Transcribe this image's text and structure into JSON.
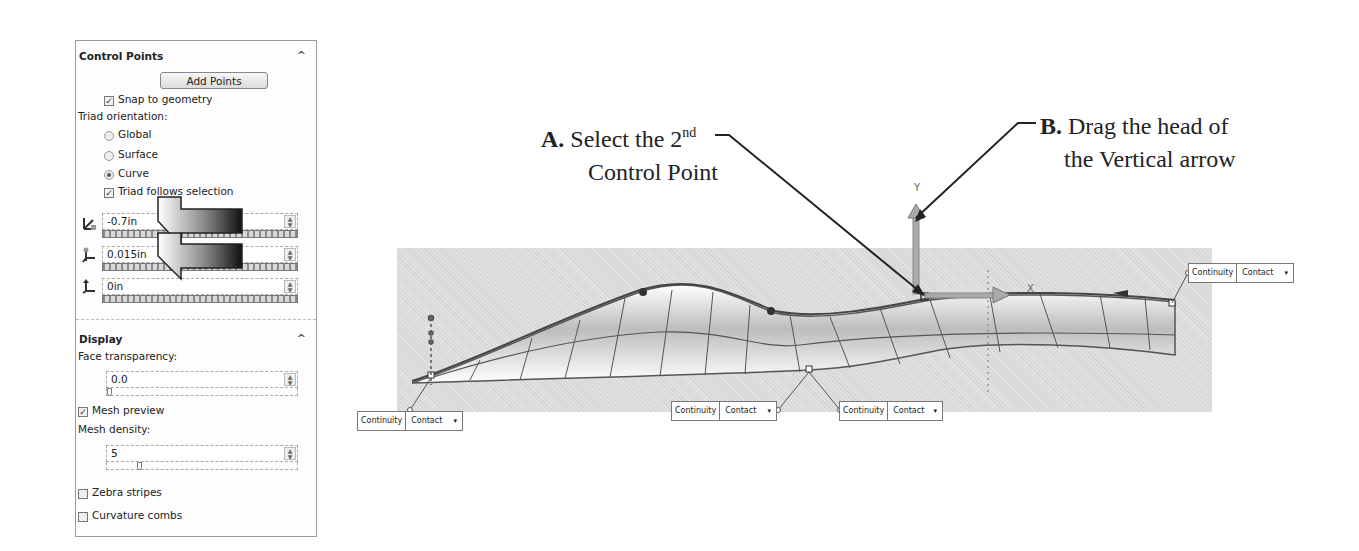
{
  "panel": {
    "control_points": {
      "title": "Control Points",
      "collapse_icon": "^",
      "add_points_label": "Add Points",
      "snap_to_geometry": {
        "label": "Snap to geometry",
        "checked": true
      },
      "triad_orientation_label": "Triad orientation:",
      "orientation_options": [
        {
          "label": "Global",
          "selected": false
        },
        {
          "label": "Surface",
          "selected": false
        },
        {
          "label": "Curve",
          "selected": true
        }
      ],
      "triad_follows_selection": {
        "label": "Triad follows selection",
        "checked": true
      },
      "values": [
        {
          "axis": "x-direction-icon",
          "value": "-0.7in"
        },
        {
          "axis": "y-direction-icon",
          "value": "0.015in"
        },
        {
          "axis": "z-direction-icon",
          "value": "0in"
        }
      ],
      "spin_up": "▲",
      "spin_down": "▼"
    },
    "display": {
      "title": "Display",
      "collapse_icon": "^",
      "face_transparency_label": "Face transparency:",
      "face_transparency_value": "0.0",
      "mesh_preview": {
        "label": "Mesh preview",
        "checked": true
      },
      "mesh_density_label": "Mesh density:",
      "mesh_density_value": "5",
      "zebra_stripes": {
        "label": "Zebra stripes",
        "checked": false
      },
      "curvature_combs": {
        "label": "Curvature combs",
        "checked": false
      }
    },
    "check_glyph": "✓"
  },
  "annotations": {
    "a": {
      "letter": "A.",
      "line1": "Select the 2",
      "sup": "nd",
      "line2": "Control Point"
    },
    "b": {
      "letter": "B.",
      "line1": "Drag the head of",
      "line2": "the Vertical arrow"
    }
  },
  "viewport": {
    "triad_labels": {
      "y": "Y",
      "x": "X"
    },
    "continuity_boxes": [
      {
        "id": "left-end",
        "label": "Continuity",
        "value": "Contact",
        "dropdown": "▾"
      },
      {
        "id": "middle-left",
        "label": "Continuity",
        "value": "Contact",
        "dropdown": "▾"
      },
      {
        "id": "middle-right",
        "label": "Continuity",
        "value": "Contact",
        "dropdown": "▾"
      },
      {
        "id": "right-end",
        "label": "Continuity",
        "value": "Contact",
        "dropdown": "▾"
      }
    ]
  }
}
